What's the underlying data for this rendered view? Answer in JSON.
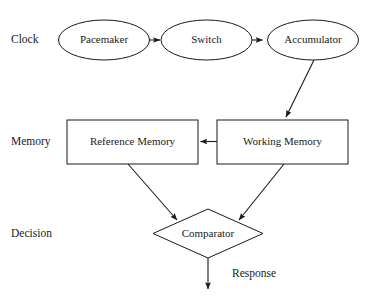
{
  "diagram": {
    "colors": {
      "background": "#ffffff",
      "stroke": "#1a1a1a",
      "fill": "#ffffff",
      "text": "#1a1a1a"
    },
    "row_labels": [
      {
        "id": "clock",
        "text": "Clock"
      },
      {
        "id": "memory",
        "text": "Memory"
      },
      {
        "id": "decision",
        "text": "Decision"
      }
    ],
    "nodes": [
      {
        "id": "pacemaker",
        "text": "Pacemaker",
        "shape": "ellipse",
        "row": "clock"
      },
      {
        "id": "switch",
        "text": "Switch",
        "shape": "ellipse",
        "row": "clock"
      },
      {
        "id": "accumulator",
        "text": "Accumulator",
        "shape": "ellipse",
        "row": "clock"
      },
      {
        "id": "reference-memory",
        "text": "Reference Memory",
        "shape": "rectangle",
        "row": "memory"
      },
      {
        "id": "working-memory",
        "text": "Working Memory",
        "shape": "rectangle",
        "row": "memory"
      },
      {
        "id": "comparator",
        "text": "Comparator",
        "shape": "diamond",
        "row": "decision"
      }
    ],
    "edges": [
      {
        "id": "pacemaker-switch",
        "from": "pacemaker",
        "to": "switch",
        "label": ""
      },
      {
        "id": "switch-accumulator",
        "from": "switch",
        "to": "accumulator",
        "label": ""
      },
      {
        "id": "accumulator-working-memory",
        "from": "accumulator",
        "to": "working-memory",
        "label": ""
      },
      {
        "id": "working-memory-reference-memory",
        "from": "working-memory",
        "to": "reference-memory",
        "label": ""
      },
      {
        "id": "reference-memory-comparator",
        "from": "reference-memory",
        "to": "comparator",
        "label": ""
      },
      {
        "id": "working-memory-comparator",
        "from": "working-memory",
        "to": "comparator",
        "label": ""
      },
      {
        "id": "comparator-response",
        "from": "comparator",
        "to": "",
        "label": "Response"
      }
    ]
  }
}
